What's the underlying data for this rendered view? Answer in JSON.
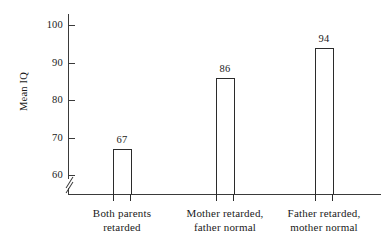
{
  "chart_data": {
    "type": "bar",
    "title": "",
    "xlabel": "",
    "ylabel": "Mean IQ",
    "categories": [
      "Both parents\nretarded",
      "Mother retarded,\nfather normal",
      "Father retarded,\nmother normal"
    ],
    "category_lines": [
      [
        "Both parents",
        "retarded"
      ],
      [
        "Mother retarded,",
        "father normal"
      ],
      [
        "Father retarded,",
        "mother normal"
      ]
    ],
    "values": [
      67,
      86,
      94
    ],
    "value_labels": [
      "67",
      "86",
      "94"
    ],
    "ylim": [
      55,
      103
    ],
    "yticks": [
      60,
      70,
      80,
      90,
      100
    ],
    "ytick_labels": [
      "60",
      "70",
      "80",
      "90",
      "100"
    ],
    "axis_break": true,
    "grid": false,
    "legend": null,
    "bar_fill_color": "#ffffff",
    "bar_edge_color": "#2b2b2b",
    "axis_color": "#3a3a3a",
    "background_color": "#ffffff"
  }
}
